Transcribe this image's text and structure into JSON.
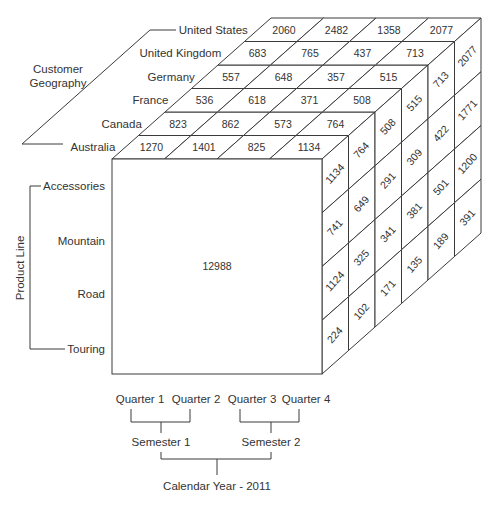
{
  "diagram": {
    "total_label": "12988",
    "geography": {
      "axis_label_line1": "Customer",
      "axis_label_line2": "Geography",
      "members_front_to_back": [
        "Australia",
        "Canada",
        "France",
        "Germany",
        "United Kingdom",
        "United States"
      ]
    },
    "product_line": {
      "axis_label": "Product Line",
      "members": [
        "Accessories",
        "Mountain",
        "Road",
        "Touring"
      ]
    },
    "time": {
      "quarters": [
        "Quarter 1",
        "Quarter 2",
        "Quarter 3",
        "Quarter 4"
      ],
      "semesters": [
        "Semester 1",
        "Semester 2"
      ],
      "year": "Calendar Year - 2011"
    },
    "top_face_values": {
      "note": "rows = countries (front to back), columns = quarters",
      "Australia": [
        "1270",
        "1401",
        "825",
        "1134"
      ],
      "Canada": [
        "823",
        "862",
        "573",
        "764"
      ],
      "France": [
        "536",
        "618",
        "371",
        "508"
      ],
      "Germany": [
        "557",
        "648",
        "357",
        "515"
      ],
      "United Kingdom": [
        "683",
        "765",
        "437",
        "713"
      ],
      "United States": [
        "2060",
        "2482",
        "1358",
        "2077"
      ]
    },
    "right_face_values": {
      "note": "columns = countries (front to back), rows = product lines",
      "Australia": [
        "1134",
        "741",
        "1124",
        "224"
      ],
      "Canada": [
        "764",
        "649",
        "325",
        "102"
      ],
      "France": [
        "508",
        "291",
        "341",
        "171"
      ],
      "Germany": [
        "515",
        "309",
        "381",
        "135"
      ],
      "United Kingdom": [
        "713",
        "422",
        "501",
        "189"
      ],
      "United States": [
        "2077",
        "1771",
        "1200",
        "391"
      ]
    },
    "colors": {
      "line": "#3a3a3a",
      "text": "#333333",
      "background": "#ffffff"
    }
  }
}
